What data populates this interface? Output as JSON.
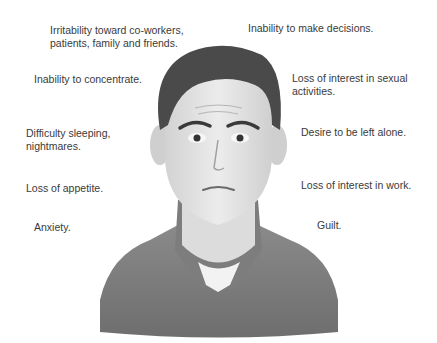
{
  "left_labels": [
    {
      "line1": "Irritability toward co-workers,",
      "line2": "patients, family and friends."
    },
    {
      "line1": "Inability to concentrate.",
      "line2": ""
    },
    {
      "line1": "Difficulty sleeping,",
      "line2": "nightmares."
    },
    {
      "line1": "Loss of appetite.",
      "line2": ""
    },
    {
      "line1": "Anxiety.",
      "line2": ""
    }
  ],
  "right_labels": [
    {
      "line1": "Inability to make decisions.",
      "line2": ""
    },
    {
      "line1": "Loss of interest in sexual",
      "line2": "activities."
    },
    {
      "line1": "Desire to be left alone.",
      "line2": ""
    },
    {
      "line1": "Loss of interest in work.",
      "line2": ""
    },
    {
      "line1": "Guilt.",
      "line2": ""
    }
  ]
}
